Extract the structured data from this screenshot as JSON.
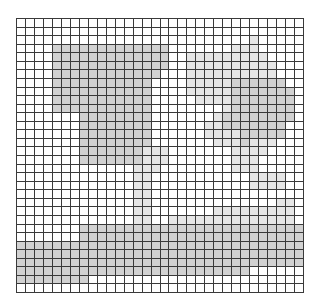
{
  "grid": {
    "columns": 32,
    "rows": 32,
    "colors": {
      "0": "#ffffff",
      "1": "#e6e6e6",
      "2": "#d2d2d2",
      "line": "#3a3a3a"
    },
    "cells": [
      "00000000000000000000000000000000",
      "00000000000000000000000000000000",
      "00000000000000000000000000100000",
      "00002222222222222000000011100000",
      "00002222222222222001111111110000",
      "00002222222222222001111111111000",
      "00002222222222220001111111111000",
      "00002222222222200001111122222200",
      "00002222222222200001111122222220",
      "00002222222222200000111122222220",
      "00002222222222200000000122222220",
      "00000002222222200000001222222220",
      "00000002222222200000011222222200",
      "00000002222222200000011112222200",
      "00000002222222200000001112111000",
      "00000002222222111000000011110000",
      "00000002222222111000000011100000",
      "00000000000001110000000011100000",
      "00000000000001100000000000111100",
      "00000000000001100000000000111100",
      "00000000000001100000000000000000",
      "00000000000001100000000000000110",
      "00000000000001100000001111111110",
      "00000000000001100111111111111110",
      "00000002222222222222222222222222",
      "00000002222222222222222222222222",
      "22222222222222222222222222222222",
      "22222222222222222222222222222222",
      "22222222222222222222222222222222",
      "22222222222222222222222222000000",
      "22222222000000000000000000000000",
      "00000000000000000000000000000000"
    ]
  }
}
